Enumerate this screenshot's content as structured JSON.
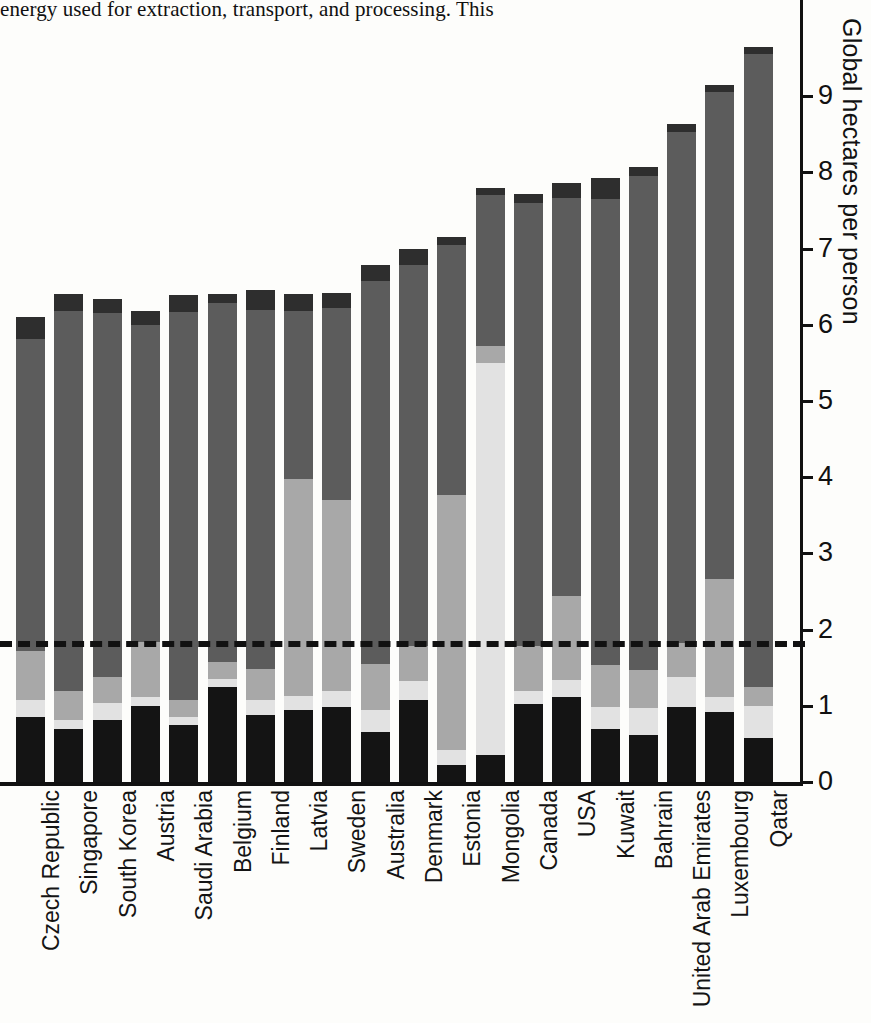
{
  "page": {
    "body_text": "energy used for extraction, transport, and processing. This"
  },
  "chart_data": {
    "type": "bar",
    "subtype": "stacked-bar",
    "title": "",
    "xlabel": "",
    "ylabel": "Global hectares per person",
    "ylim": [
      0,
      9.6
    ],
    "yticks": [
      "0",
      "1",
      "2",
      "3",
      "4",
      "5",
      "6",
      "7",
      "8",
      "9"
    ],
    "grid": false,
    "legend_position": "none",
    "annotations": [
      {
        "name": "world-biocapacity-line",
        "style": "dashed",
        "value": 1.72,
        "label": ""
      }
    ],
    "series": [
      {
        "name": "Cropland",
        "color": "#141414"
      },
      {
        "name": "Grazing land",
        "color": "#e2e2e2"
      },
      {
        "name": "Forest land",
        "color": "#a8a8a8"
      },
      {
        "name": "Carbon",
        "color": "#5c5c5c"
      },
      {
        "name": "Built-up land",
        "color": "#2e2e2e"
      }
    ],
    "categories": [
      "Czech Republic",
      "Singapore",
      "South Korea",
      "Austria",
      "Saudi Arabia",
      "Belgium",
      "Finland",
      "Latvia",
      "Sweden",
      "Australia",
      "Denmark",
      "Estonia",
      "Mongolia",
      "Canada",
      "USA",
      "Kuwait",
      "Bahrain",
      "United Arab Emirates",
      "Luxembourg",
      "Qatar"
    ],
    "values": {
      "Cropland": [
        0.85,
        0.7,
        0.82,
        1.0,
        0.75,
        1.25,
        0.88,
        0.95,
        0.98,
        0.65,
        1.08,
        0.22,
        0.35,
        1.02,
        1.12,
        0.7,
        0.62,
        0.98,
        0.92,
        0.58
      ],
      "Grazing land": [
        0.22,
        0.12,
        0.22,
        0.12,
        0.1,
        0.1,
        0.2,
        0.18,
        0.22,
        0.3,
        0.25,
        0.2,
        5.15,
        0.18,
        0.22,
        0.28,
        0.35,
        0.4,
        0.2,
        0.42
      ],
      "Forest land": [
        0.65,
        0.38,
        0.34,
        0.72,
        0.22,
        0.22,
        0.4,
        2.85,
        2.5,
        0.6,
        0.45,
        3.35,
        0.22,
        0.58,
        1.1,
        0.55,
        0.5,
        0.45,
        1.55,
        0.25
      ],
      "Carbon": [
        4.1,
        4.98,
        4.78,
        4.16,
        5.1,
        4.72,
        4.72,
        2.2,
        2.52,
        5.02,
        5.0,
        3.28,
        1.98,
        5.82,
        5.22,
        6.12,
        6.48,
        6.7,
        6.38,
        8.3
      ],
      "Built-up land": [
        0.28,
        0.22,
        0.18,
        0.18,
        0.22,
        0.12,
        0.26,
        0.22,
        0.2,
        0.22,
        0.22,
        0.1,
        0.1,
        0.12,
        0.2,
        0.28,
        0.12,
        0.1,
        0.1,
        0.1
      ]
    },
    "totals": [
      6.1,
      6.4,
      6.34,
      6.18,
      6.39,
      6.41,
      6.46,
      6.4,
      6.42,
      6.79,
      7.0,
      7.15,
      7.8,
      7.72,
      7.86,
      7.93,
      8.07,
      8.63,
      9.15,
      9.65
    ]
  },
  "axis": {
    "label": "Global hectares per person"
  }
}
